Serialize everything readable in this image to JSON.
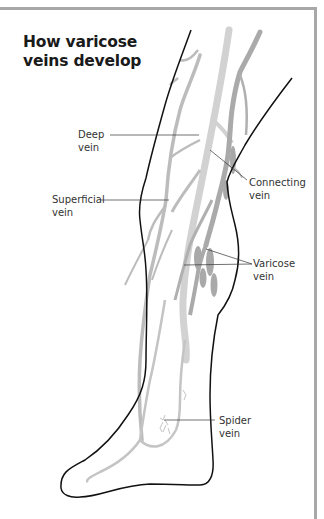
{
  "title": {
    "line1": "How varicose",
    "line2": "veins develop"
  },
  "labels": [
    {
      "id": "deep",
      "line1": "Deep",
      "line2": "vein"
    },
    {
      "id": "superficial",
      "line1": "Superficial",
      "line2": "vein"
    },
    {
      "id": "connecting",
      "line1": "Connecting",
      "line2": "vein"
    },
    {
      "id": "varicose",
      "line1": "Varicose",
      "line2": "vein"
    },
    {
      "id": "spider",
      "line1": "Spider",
      "line2": "vein"
    }
  ],
  "caption": "",
  "colors": {
    "outline": "#111111",
    "deep_vein": "#cfcfcf",
    "superficial_vein": "#b8b8b8",
    "varicose_vein": "#a9a9a9",
    "frame": "#a8a8a8",
    "leader": "#333333"
  }
}
